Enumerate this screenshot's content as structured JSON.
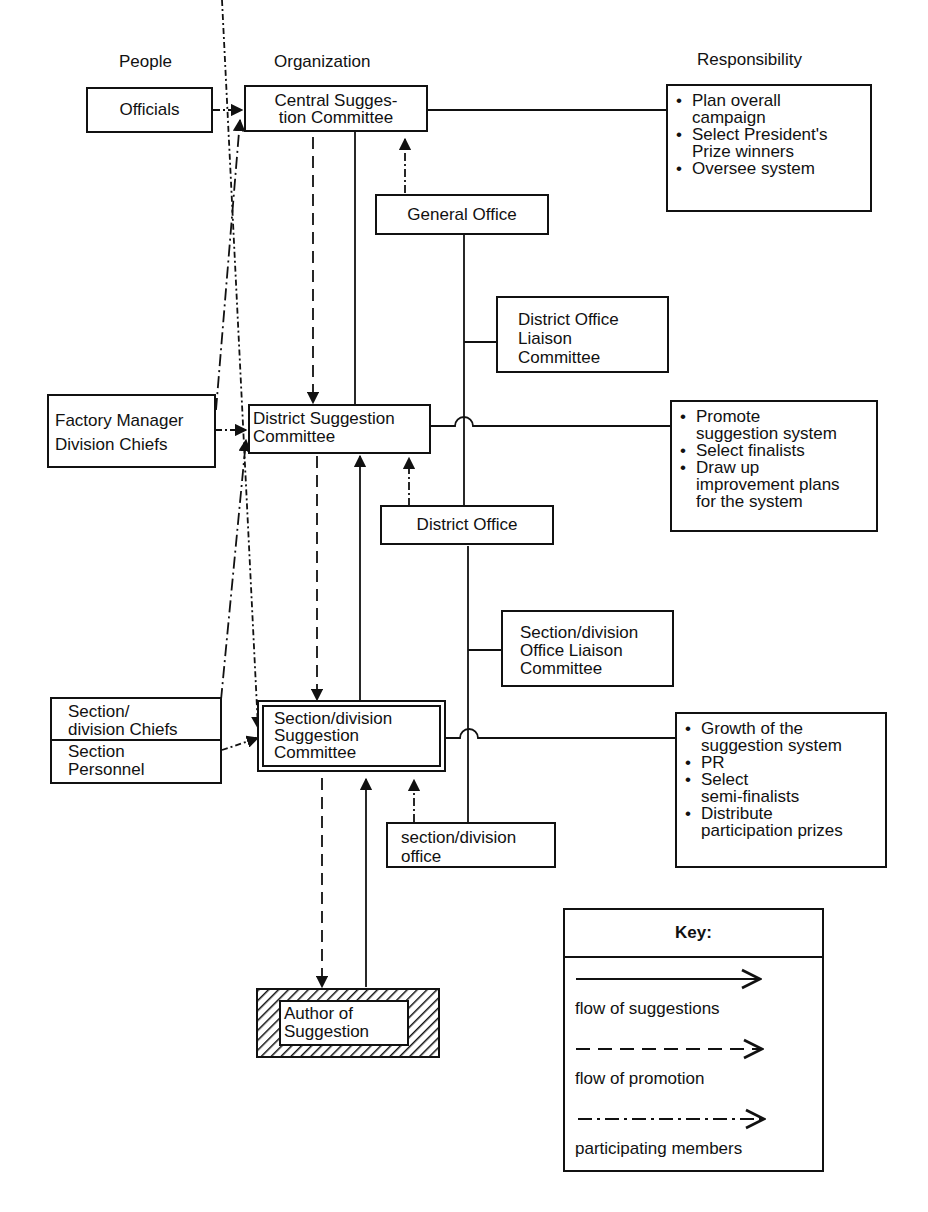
{
  "headers": {
    "people": "People",
    "organization": "Organization",
    "responsibility": "Responsibility"
  },
  "people": {
    "officials": "Officials",
    "factory_line1": "Factory Manager",
    "factory_line2": "Division Chiefs",
    "section_chiefs_line1": "Section/",
    "section_chiefs_line2": "division Chiefs",
    "section_personnel_line1": "Section",
    "section_personnel_line2": "Personnel"
  },
  "organization": {
    "central_line1": "Central Sugges-",
    "central_line2": "tion Committee",
    "district_line1": "District Suggestion",
    "district_line2": "Committee",
    "section_line1": "Section/division",
    "section_line2": "Suggestion",
    "section_line3": "Committee",
    "author_line1": "Author of",
    "author_line2": "Suggestion"
  },
  "offices": {
    "general_office": "General Office",
    "district_liaison_line1": "District Office",
    "district_liaison_line2": "Liaison",
    "district_liaison_line3": "Committee",
    "district_office": "District Office",
    "section_liaison_line1": "Section/division",
    "section_liaison_line2": "Office Liaison",
    "section_liaison_line3": "Committee",
    "section_office_line1": "section/division",
    "section_office_line2": "office"
  },
  "responsibilities": {
    "central": [
      [
        "Plan overall",
        "campaign"
      ],
      [
        "Select President's",
        "Prize winners"
      ],
      [
        "Oversee system"
      ]
    ],
    "district": [
      [
        "Promote",
        "suggestion system"
      ],
      [
        "Select finalists"
      ],
      [
        "Draw up",
        "improvement plans",
        "for the system"
      ]
    ],
    "section": [
      [
        "Growth of the",
        "suggestion system"
      ],
      [
        "PR"
      ],
      [
        "Select",
        "semi-finalists"
      ],
      [
        "Distribute",
        "participation prizes"
      ]
    ]
  },
  "key": {
    "title": "Key:",
    "items": [
      {
        "label": "flow of suggestions",
        "style": "solid"
      },
      {
        "label": "flow of promotion",
        "style": "dashed"
      },
      {
        "label": "participating members",
        "style": "dash-dot"
      }
    ]
  },
  "colors": {
    "ink": "#111111",
    "paper": "#ffffff"
  }
}
